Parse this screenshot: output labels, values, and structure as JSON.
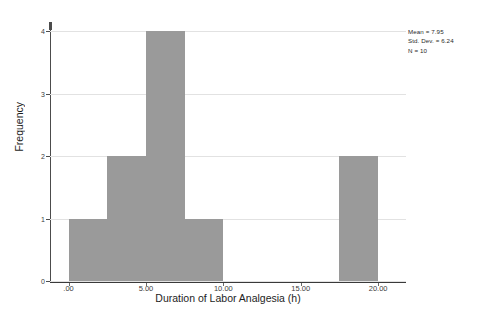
{
  "chart_data": {
    "type": "bar",
    "title": "",
    "subtitle": "",
    "xlabel": "Duration of Labor Analgesia (h)",
    "ylabel": "Frequency",
    "xlim": [
      -1.2,
      21.8
    ],
    "ylim": [
      0,
      4.15
    ],
    "grid": true,
    "legend": false,
    "bar_color": "#9a9a9a",
    "bin_width": 2.5,
    "x_tick_labels": [
      ".00",
      "5.00",
      "10.00",
      "15.00",
      "20.00"
    ],
    "x_tick_values": [
      0,
      5,
      10,
      15,
      20
    ],
    "y_tick_labels": [
      "0",
      "1",
      "2",
      "3",
      "4"
    ],
    "y_tick_values": [
      0,
      1,
      2,
      3,
      4
    ],
    "bins": [
      {
        "x_start": 0.0,
        "x_end": 2.5,
        "frequency": 1
      },
      {
        "x_start": 2.5,
        "x_end": 5.0,
        "frequency": 2
      },
      {
        "x_start": 5.0,
        "x_end": 7.5,
        "frequency": 4
      },
      {
        "x_start": 7.5,
        "x_end": 10.0,
        "frequency": 1
      },
      {
        "x_start": 17.5,
        "x_end": 20.0,
        "frequency": 2
      }
    ],
    "categories": [
      "0.0–2.5",
      "2.5–5.0",
      "5.0–7.5",
      "7.5–10.0",
      "17.5–20.0"
    ],
    "values": [
      1,
      2,
      4,
      1,
      2
    ],
    "annotations": {
      "mean_label": "Mean = 7.95",
      "std_dev_label": "Std. Dev. = 6.24",
      "n_label": "N = 10"
    },
    "statistics": {
      "mean": 7.95,
      "std_dev": 6.24,
      "n": 10
    }
  }
}
